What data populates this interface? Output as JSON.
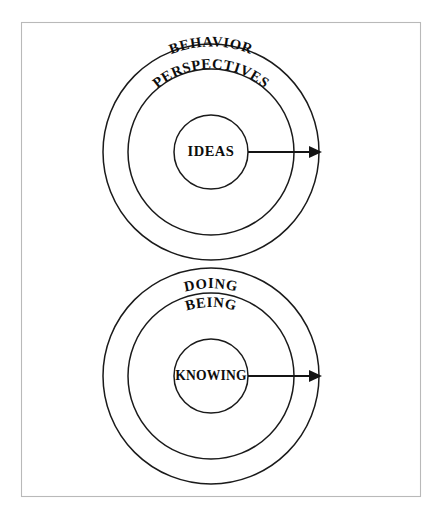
{
  "figure": {
    "background_color": "#ffffff",
    "frame_border_color": "#b9b9b9",
    "line_color": "#1a1a1a",
    "text_color": "#0d0d0d"
  },
  "diagrams": [
    {
      "id": "top-diagram",
      "name": "behavior-perspectives-ideas",
      "center": {
        "x": 211,
        "y": 152
      },
      "rings": [
        {
          "level": "outer",
          "label": "BEHAVIOR",
          "radius": 108,
          "label_curved": true
        },
        {
          "level": "middle",
          "label": "PERSPECTIVES",
          "radius": 83,
          "label_curved": true
        },
        {
          "level": "inner",
          "label": "IDEAS",
          "radius": 37,
          "label_curved": false
        }
      ],
      "arrow": {
        "name": "outward-arrow",
        "from_x": 248,
        "to_x": 326,
        "y": 152,
        "direction": "right"
      }
    },
    {
      "id": "bottom-diagram",
      "name": "doing-being-knowing",
      "center": {
        "x": 211,
        "y": 376
      },
      "rings": [
        {
          "level": "outer",
          "label": "DOING",
          "radius": 108,
          "label_curved": true
        },
        {
          "level": "middle",
          "label": "BEING",
          "radius": 83,
          "label_curved": true
        },
        {
          "level": "inner",
          "label": "KNOWING",
          "radius": 37,
          "label_curved": false
        }
      ],
      "arrow": {
        "name": "outward-arrow",
        "from_x": 248,
        "to_x": 326,
        "y": 376,
        "direction": "right"
      }
    }
  ],
  "frame": {
    "x": 21,
    "y": 22,
    "width": 400,
    "height": 475
  }
}
